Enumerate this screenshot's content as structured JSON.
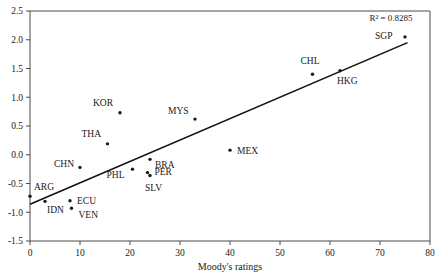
{
  "chart_data": {
    "type": "scatter",
    "title": "",
    "xlabel": "Moody's ratings",
    "ylabel": "",
    "xlim": [
      0,
      80
    ],
    "ylim": [
      -1.5,
      2.5
    ],
    "xticks": [
      "0",
      "10",
      "20",
      "30",
      "40",
      "50",
      "60",
      "70",
      "80"
    ],
    "yticks": [
      "-1.5",
      "-1.0",
      "-0.5",
      "0.0",
      "0.5",
      "1.0",
      "1.5",
      "2.0",
      "2.5"
    ],
    "grid": false,
    "legend": "none",
    "annotations": [
      {
        "name": "r-squared",
        "text": "R² = 0.8285",
        "x": 76.5,
        "y": 2.33
      }
    ],
    "trendline": {
      "name": "linear-fit",
      "x_start": 0.0,
      "y_start": -0.86,
      "x_end": 75.5,
      "y_end": 1.95,
      "r_squared": 0.8285
    },
    "points": [
      {
        "label": "ARG",
        "x": 0.0,
        "y": -0.72,
        "label_dx": 4,
        "label_dy": -6
      },
      {
        "label": "IDN",
        "x": 3.0,
        "y": -0.81,
        "label_dx": 2,
        "label_dy": 12
      },
      {
        "label": "ECU",
        "x": 8.0,
        "y": -0.8,
        "label_dx": 7,
        "label_dy": 3
      },
      {
        "label": "VEN",
        "x": 8.3,
        "y": -0.93,
        "label_dx": 7,
        "label_dy": 10
      },
      {
        "label": "CHN",
        "x": 10.0,
        "y": -0.22,
        "label_dx": -26,
        "label_dy": 0
      },
      {
        "label": "THA",
        "x": 15.5,
        "y": 0.19,
        "label_dx": -26,
        "label_dy": -7
      },
      {
        "label": "KOR",
        "x": 18.0,
        "y": 0.73,
        "label_dx": -27,
        "label_dy": -7
      },
      {
        "label": "PHL",
        "x": 20.5,
        "y": -0.25,
        "label_dx": -26,
        "label_dy": 9
      },
      {
        "label": "BRA",
        "x": 24.0,
        "y": -0.08,
        "label_dx": 5,
        "label_dy": 9
      },
      {
        "label": "PER",
        "x": 23.5,
        "y": -0.31,
        "label_dx": 7,
        "label_dy": 2
      },
      {
        "label": "SLV",
        "x": 24.0,
        "y": -0.36,
        "label_dx": -5,
        "label_dy": 16
      },
      {
        "label": "MYS",
        "x": 33.0,
        "y": 0.62,
        "label_dx": -27,
        "label_dy": -5
      },
      {
        "label": "MEX",
        "x": 40.0,
        "y": 0.08,
        "label_dx": 7,
        "label_dy": 4
      },
      {
        "label": "CHL",
        "x": 56.5,
        "y": 1.4,
        "label_dx": -12,
        "label_dy": -10
      },
      {
        "label": "HKG",
        "x": 62.0,
        "y": 1.46,
        "label_dx": -3,
        "label_dy": 13
      },
      {
        "label": "SGP",
        "x": 75.0,
        "y": 2.05,
        "label_dx": -30,
        "label_dy": 2
      }
    ]
  }
}
